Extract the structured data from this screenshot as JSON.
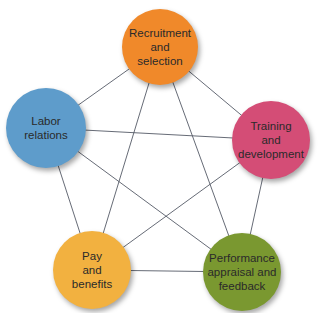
{
  "diagram": {
    "type": "pentagram-network",
    "nodes": [
      {
        "id": "recruitment",
        "label": "Recruitment\nand\nselection",
        "color": "#f0892a",
        "cx": 160,
        "cy": 47,
        "r": 38
      },
      {
        "id": "training",
        "label": "Training\nand\ndevelopment",
        "color": "#d44d76",
        "cx": 271,
        "cy": 140,
        "r": 39
      },
      {
        "id": "performance",
        "label": "Performance\nappraisal and\nfeedback",
        "color": "#7a9830",
        "cx": 242,
        "cy": 272,
        "r": 39
      },
      {
        "id": "pay",
        "label": "Pay\nand\nbenefits",
        "color": "#f2b140",
        "cx": 92,
        "cy": 270,
        "r": 39
      },
      {
        "id": "labor",
        "label": "Labor\nrelations",
        "color": "#5e9ccb",
        "cx": 46,
        "cy": 128,
        "r": 40
      }
    ],
    "edges": [
      [
        "recruitment",
        "training"
      ],
      [
        "training",
        "performance"
      ],
      [
        "performance",
        "pay"
      ],
      [
        "pay",
        "labor"
      ],
      [
        "labor",
        "recruitment"
      ],
      [
        "recruitment",
        "performance"
      ],
      [
        "recruitment",
        "pay"
      ],
      [
        "training",
        "labor"
      ],
      [
        "training",
        "pay"
      ],
      [
        "labor",
        "performance"
      ]
    ],
    "edge_color": "#555a66"
  }
}
